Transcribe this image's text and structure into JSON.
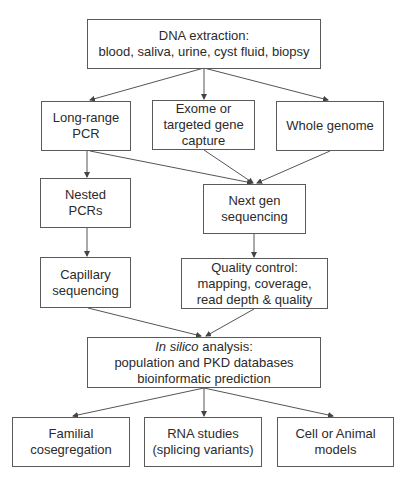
{
  "nodes": {
    "dna": {
      "lines": [
        "DNA extraction:",
        "blood, saliva, urine, cyst fluid, biopsy"
      ]
    },
    "lrpcr": {
      "lines": [
        "Long-range",
        "PCR"
      ]
    },
    "exome": {
      "lines": [
        "Exome or",
        "targeted gene",
        "capture"
      ]
    },
    "wg": {
      "lines": [
        "Whole genome"
      ]
    },
    "nested": {
      "lines": [
        "Nested",
        "PCRs"
      ]
    },
    "ngs": {
      "lines": [
        "Next gen",
        "sequencing"
      ]
    },
    "capillary": {
      "lines": [
        "Capillary",
        "sequencing"
      ]
    },
    "qc": {
      "lines": [
        "Quality control:",
        "mapping, coverage,",
        "read depth & quality"
      ]
    },
    "insilico": {
      "italic": "In silico",
      "line1_rest": " analysis:",
      "lines": [
        "population and PKD databases",
        "bioinformatic prediction"
      ]
    },
    "familial": {
      "lines": [
        "Familial",
        "cosegregation"
      ]
    },
    "rna": {
      "lines": [
        "RNA studies",
        "(splicing variants)"
      ]
    },
    "cell": {
      "lines": [
        "Cell or Animal",
        "models"
      ]
    }
  },
  "edges": [
    [
      "dna",
      "lrpcr"
    ],
    [
      "dna",
      "exome"
    ],
    [
      "dna",
      "wg"
    ],
    [
      "lrpcr",
      "nested"
    ],
    [
      "lrpcr",
      "ngs"
    ],
    [
      "exome",
      "ngs"
    ],
    [
      "wg",
      "ngs"
    ],
    [
      "nested",
      "capillary"
    ],
    [
      "ngs",
      "qc"
    ],
    [
      "capillary",
      "insilico"
    ],
    [
      "qc",
      "insilico"
    ],
    [
      "insilico",
      "familial"
    ],
    [
      "insilico",
      "rna"
    ],
    [
      "insilico",
      "cell"
    ]
  ],
  "colors": {
    "stroke": "#5a5a5a",
    "text": "#2b2b2b",
    "background": "#ffffff"
  }
}
